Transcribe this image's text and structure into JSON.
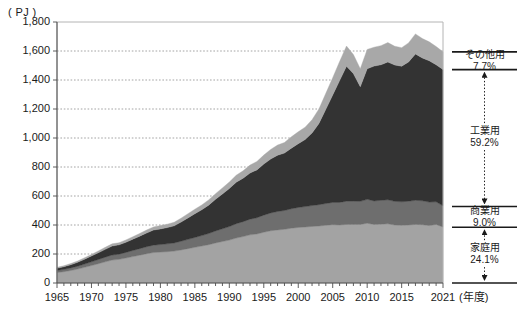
{
  "chart_data": {
    "type": "area",
    "stacked": true,
    "title": "",
    "subtitle": "",
    "xlabel": "(年度)",
    "ylabel": "( PJ )",
    "unit": "PJ",
    "grid": true,
    "legend_position": "right",
    "xlim": [
      1965,
      2021
    ],
    "ylim": [
      0,
      1800
    ],
    "ytick_step": 200,
    "ytick_labels": [
      "0",
      "200",
      "400",
      "600",
      "800",
      "1,000",
      "1,200",
      "1,400",
      "1,600",
      "1,800"
    ],
    "ytick_values": [
      0,
      200,
      400,
      600,
      800,
      1000,
      1200,
      1400,
      1600,
      1800
    ],
    "xtick_labels": [
      "1965",
      "1970",
      "1975",
      "1980",
      "1985",
      "1990",
      "1995",
      "2000",
      "2005",
      "2010",
      "2015",
      "2021"
    ],
    "xtick_values": [
      1965,
      1970,
      1975,
      1980,
      1985,
      1990,
      1995,
      2000,
      2005,
      2010,
      2015,
      2021
    ],
    "x": [
      1965,
      1966,
      1967,
      1968,
      1969,
      1970,
      1971,
      1972,
      1973,
      1974,
      1975,
      1976,
      1977,
      1978,
      1979,
      1980,
      1981,
      1982,
      1983,
      1984,
      1985,
      1986,
      1987,
      1988,
      1989,
      1990,
      1991,
      1992,
      1993,
      1994,
      1995,
      1996,
      1997,
      1998,
      1999,
      2000,
      2001,
      2002,
      2003,
      2004,
      2005,
      2006,
      2007,
      2008,
      2009,
      2010,
      2011,
      2012,
      2013,
      2014,
      2015,
      2016,
      2017,
      2018,
      2019,
      2020,
      2021
    ],
    "series": [
      {
        "name": "家庭用",
        "label": "家庭用",
        "share_percent": 24.1,
        "color": "#a3a3a3",
        "values": [
          72,
          78,
          86,
          96,
          108,
          120,
          133,
          146,
          158,
          163,
          172,
          182,
          192,
          202,
          210,
          213,
          216,
          220,
          228,
          237,
          246,
          255,
          264,
          276,
          286,
          296,
          310,
          320,
          332,
          338,
          350,
          360,
          366,
          370,
          378,
          383,
          386,
          390,
          393,
          398,
          402,
          400,
          404,
          404,
          404,
          412,
          404,
          406,
          408,
          400,
          398,
          400,
          404,
          402,
          396,
          404,
          386
        ]
      },
      {
        "name": "商業用",
        "label": "商業用",
        "share_percent": 9.0,
        "color": "#6e6e6e",
        "values": [
          14,
          16,
          18,
          20,
          23,
          26,
          29,
          32,
          35,
          36,
          39,
          42,
          45,
          48,
          51,
          52,
          54,
          56,
          60,
          64,
          68,
          72,
          77,
          83,
          88,
          93,
          99,
          103,
          108,
          112,
          118,
          123,
          127,
          130,
          134,
          138,
          141,
          144,
          147,
          150,
          154,
          156,
          160,
          160,
          159,
          165,
          162,
          164,
          166,
          163,
          162,
          164,
          166,
          165,
          162,
          156,
          146
        ]
      },
      {
        "name": "工業用",
        "label": "工業用",
        "share_percent": 59.2,
        "color": "#333333",
        "values": [
          16,
          18,
          22,
          27,
          33,
          40,
          47,
          54,
          62,
          64,
          70,
          78,
          86,
          95,
          104,
          108,
          112,
          118,
          132,
          148,
          164,
          178,
          196,
          218,
          240,
          262,
          286,
          300,
          318,
          330,
          352,
          372,
          388,
          396,
          418,
          440,
          462,
          500,
          560,
          650,
          740,
          840,
          930,
          880,
          790,
          900,
          930,
          935,
          950,
          940,
          935,
          960,
          1010,
          985,
          975,
          945,
          940
        ]
      },
      {
        "name": "その他用",
        "label": "その他用",
        "share_percent": 7.7,
        "color": "#a8a8a8",
        "values": [
          6,
          7,
          8,
          9,
          10,
          11,
          12,
          14,
          15,
          15,
          16,
          17,
          19,
          20,
          22,
          23,
          24,
          25,
          27,
          29,
          31,
          33,
          36,
          39,
          42,
          45,
          48,
          51,
          55,
          58,
          62,
          66,
          70,
          73,
          78,
          82,
          86,
          92,
          100,
          110,
          120,
          132,
          140,
          132,
          124,
          134,
          130,
          132,
          134,
          130,
          128,
          132,
          138,
          134,
          130,
          126,
          122
        ]
      }
    ],
    "annotations": [
      {
        "label": "その他用",
        "value": "7.7%"
      },
      {
        "label": "工業用",
        "value": "59.2%"
      },
      {
        "label": "商業用",
        "value": "9.0%"
      },
      {
        "label": "家庭用",
        "value": "24.1%"
      }
    ]
  },
  "legend": {
    "items": [
      {
        "label": "その他用",
        "percent": "7.7%",
        "share": 7.7,
        "color": "#a8a8a8"
      },
      {
        "label": "工業用",
        "percent": "59.2%",
        "share": 59.2,
        "color": "#333333"
      },
      {
        "label": "商業用",
        "percent": "9.0%",
        "share": 9.0,
        "color": "#6e6e6e"
      },
      {
        "label": "家庭用",
        "percent": "24.1%",
        "share": 24.1,
        "color": "#a3a3a3"
      }
    ]
  },
  "axes": {
    "y_unit_label": "( PJ )",
    "x_unit_label": "(年度)"
  }
}
